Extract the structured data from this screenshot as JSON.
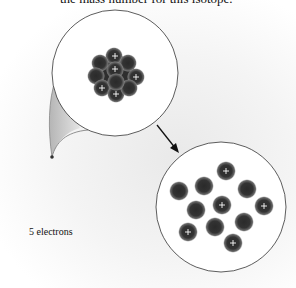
{
  "question": {
    "text": "the mass number for this isotope."
  },
  "label": {
    "text": "5 electrons"
  },
  "upper_circle": {
    "description": "magnified nucleus (clustered)",
    "plus_marks": [
      [
        115,
        56
      ],
      [
        115,
        69
      ],
      [
        136,
        77
      ],
      [
        102,
        88
      ],
      [
        116,
        94
      ]
    ]
  },
  "lower_circle": {
    "description": "nucleus particles spread out",
    "particles": [
      {
        "x": 226,
        "y": 171,
        "proton": true
      },
      {
        "x": 204,
        "y": 186,
        "proton": false
      },
      {
        "x": 179,
        "y": 191,
        "proton": false
      },
      {
        "x": 247,
        "y": 189,
        "proton": false
      },
      {
        "x": 196,
        "y": 210,
        "proton": false
      },
      {
        "x": 222,
        "y": 205,
        "proton": true
      },
      {
        "x": 264,
        "y": 206,
        "proton": true
      },
      {
        "x": 244,
        "y": 222,
        "proton": false
      },
      {
        "x": 215,
        "y": 227,
        "proton": false
      },
      {
        "x": 188,
        "y": 232,
        "proton": true
      },
      {
        "x": 233,
        "y": 243,
        "proton": true
      }
    ],
    "proton_count": 5,
    "neutron_count": 6
  },
  "colors": {
    "particle": "#2a2a2a",
    "outline": "#333333"
  }
}
